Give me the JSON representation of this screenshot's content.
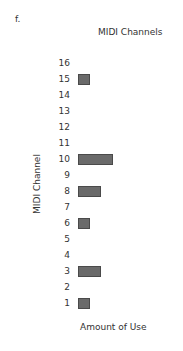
{
  "figure_label": "f.",
  "chart_data": {
    "type": "bar",
    "orientation": "horizontal",
    "title": "MIDI Channels",
    "xlabel": "Amount of Use",
    "ylabel": "MIDI Channel",
    "categories": [
      "16",
      "15",
      "14",
      "13",
      "12",
      "11",
      "10",
      "9",
      "8",
      "7",
      "6",
      "5",
      "4",
      "3",
      "2",
      "1"
    ],
    "values": [
      0,
      1,
      0,
      0,
      0,
      0,
      3,
      0,
      2,
      0,
      1,
      0,
      0,
      2,
      0,
      1
    ],
    "bar_color": "#6a6a6a",
    "grid": false,
    "legend": null
  }
}
